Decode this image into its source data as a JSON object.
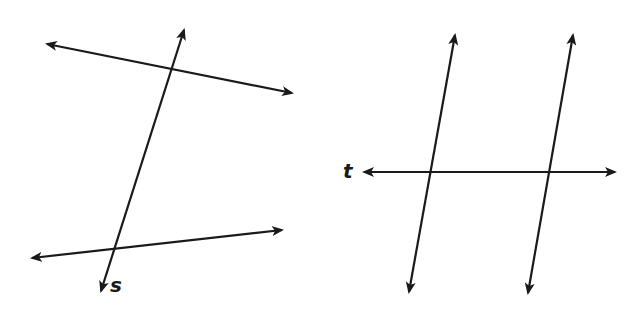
{
  "figures": [
    {
      "id": "left",
      "description": "Two non-parallel lines cut by transversal s",
      "lines": [
        {
          "name": "top-line",
          "x1": 47,
          "y1": 44,
          "x2": 292,
          "y2": 93
        },
        {
          "name": "transversal-s",
          "x1": 184,
          "y1": 30,
          "x2": 101,
          "y2": 291
        },
        {
          "name": "bottom-line",
          "x1": 32,
          "y1": 258,
          "x2": 282,
          "y2": 230
        }
      ],
      "label": {
        "text": "s",
        "x": 110,
        "y": 275
      }
    },
    {
      "id": "right",
      "description": "Two parallel lines cut by transversal t",
      "lines": [
        {
          "name": "left-parallel-line",
          "x1": 455,
          "y1": 35,
          "x2": 409,
          "y2": 292
        },
        {
          "name": "right-parallel-line",
          "x1": 573,
          "y1": 35,
          "x2": 528,
          "y2": 293
        },
        {
          "name": "transversal-t",
          "x1": 364,
          "y1": 172,
          "x2": 615,
          "y2": 172
        }
      ],
      "label": {
        "text": "t",
        "x": 343,
        "y": 161
      }
    }
  ],
  "colors": {
    "stroke": "#1a1a1a",
    "background": "#ffffff"
  }
}
